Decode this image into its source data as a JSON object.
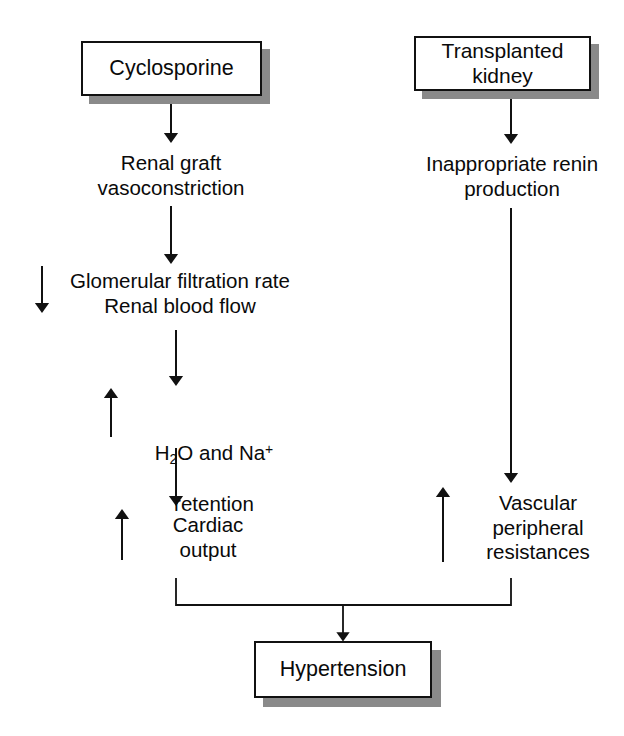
{
  "diagram": {
    "type": "flowchart",
    "background_color": "#ffffff",
    "line_color": "#111111",
    "shadow_color": "#8a8a8a"
  },
  "nodes": {
    "cyclosporine": {
      "label": "Cyclosporine",
      "shape": "box-with-shadow"
    },
    "transplanted_kidney": {
      "label": "Transplanted\nkidney",
      "shape": "box-with-shadow"
    },
    "renal_graft_vasoconstriction": {
      "label": "Renal graft\nvasoconstriction",
      "shape": "plain-text"
    },
    "inappropriate_renin": {
      "label": "Inappropriate renin\nproduction",
      "shape": "plain-text"
    },
    "gfr_rbf": {
      "label": "Glomerular filtration rate\nRenal blood flow",
      "shape": "plain-text",
      "change_arrow": "down"
    },
    "water_sodium_retention": {
      "label_line1_pre": "H",
      "label_line1_sub": "2",
      "label_line1_mid": "O and Na",
      "label_line1_sup": "+",
      "label_line2": "retention",
      "shape": "plain-text",
      "change_arrow": "up"
    },
    "cardiac_output": {
      "label": "Cardiac\noutput",
      "shape": "plain-text",
      "change_arrow": "up"
    },
    "vascular_peripheral_resistances": {
      "label": "Vascular\nperipheral\nresistances",
      "shape": "plain-text",
      "change_arrow": "up"
    },
    "hypertension": {
      "label": "Hypertension",
      "shape": "box-with-shadow"
    }
  },
  "edges": [
    {
      "from": "cyclosporine",
      "to": "renal_graft_vasoconstriction",
      "style": "arrow-down"
    },
    {
      "from": "renal_graft_vasoconstriction",
      "to": "gfr_rbf",
      "style": "arrow-down"
    },
    {
      "from": "gfr_rbf",
      "to": "water_sodium_retention",
      "style": "arrow-down"
    },
    {
      "from": "water_sodium_retention",
      "to": "cardiac_output",
      "style": "arrow-down"
    },
    {
      "from": "transplanted_kidney",
      "to": "inappropriate_renin",
      "style": "arrow-down"
    },
    {
      "from": "inappropriate_renin",
      "to": "vascular_peripheral_resistances",
      "style": "arrow-down"
    },
    {
      "from": "cardiac_output",
      "to": "hypertension",
      "style": "elbow-merge"
    },
    {
      "from": "vascular_peripheral_resistances",
      "to": "hypertension",
      "style": "elbow-merge"
    }
  ],
  "glyphs": {
    "arrow_down": "↓",
    "arrow_up": "↑"
  }
}
